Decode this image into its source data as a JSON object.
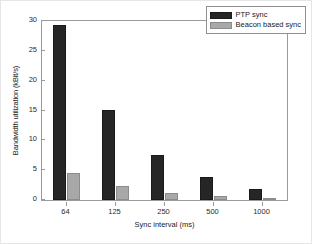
{
  "chart_data": {
    "type": "bar",
    "title": "",
    "subtitle": "",
    "xlabel": "Sync interval (ms)",
    "ylabel": "Bandwidth utilization (kBit/s)",
    "categories": [
      "64",
      "125",
      "250",
      "500",
      "1000"
    ],
    "series": [
      {
        "name": "PTP sync",
        "color": "#262626",
        "values": [
          29.3,
          15.1,
          7.5,
          3.8,
          1.9
        ]
      },
      {
        "name": "Beacon based sync",
        "color": "#a8a8a8",
        "values": [
          4.6,
          2.4,
          1.2,
          0.6,
          0.3
        ]
      }
    ],
    "ylim": [
      0,
      30
    ],
    "yticks": [
      0,
      5,
      10,
      15,
      20,
      25,
      30
    ],
    "ytick_labels": [
      "0",
      "5",
      "10",
      "15",
      "20",
      "25",
      "30"
    ],
    "grid": false,
    "legend_position": "top-right",
    "legend_entries": [
      "PTP sync",
      "Beacon based sync"
    ]
  }
}
